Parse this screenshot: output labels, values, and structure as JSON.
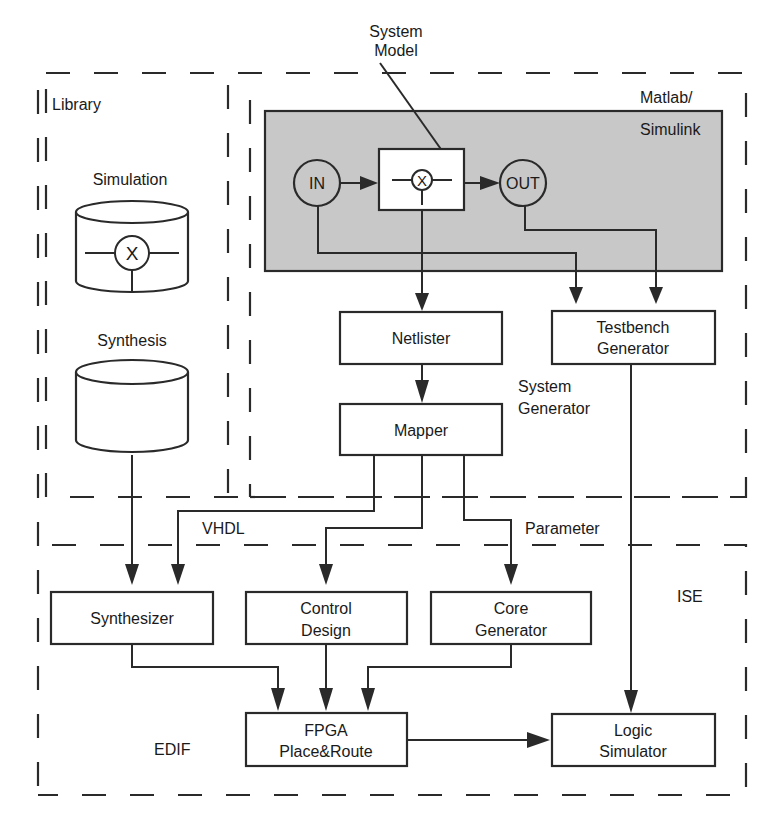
{
  "regions": {
    "library": "Library",
    "matlab_line1": "Matlab/",
    "simulink": "Simulink",
    "system_generator_line1": "System",
    "system_generator_line2": "Generator",
    "ise": "ISE"
  },
  "callout": {
    "line1": "System",
    "line2": "Model"
  },
  "library_items": {
    "simulation": "Simulation",
    "synthesis": "Synthesis",
    "multiplier_symbol": "X"
  },
  "simulink_blocks": {
    "in": "IN",
    "out": "OUT",
    "multiplier_symbol": "X"
  },
  "blocks": {
    "netlister": "Netlister",
    "testbench_line1": "Testbench",
    "testbench_line2": "Generator",
    "mapper": "Mapper",
    "synthesizer": "Synthesizer",
    "control_line1": "Control",
    "control_line2": "Design",
    "core_line1": "Core",
    "core_line2": "Generator",
    "fpga_line1": "FPGA",
    "fpga_line2": "Place&Route",
    "logic_line1": "Logic",
    "logic_line2": "Simulator"
  },
  "signals": {
    "vhdl": "VHDL",
    "parameter": "Parameter",
    "edif": "EDIF"
  },
  "colors": {
    "simulink_fill": "#c8c8c8",
    "stroke": "#2a2a2a",
    "background": "#ffffff"
  }
}
